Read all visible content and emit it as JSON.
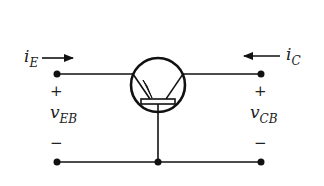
{
  "diagram": {
    "type": "common-base BJT circuit (pnp)",
    "colors": {
      "stroke": "#111111",
      "text": "#222222",
      "background": "#ffffff"
    },
    "labels": {
      "emitter_current": {
        "symbol": "i",
        "subscript": "E",
        "direction": "right"
      },
      "collector_current": {
        "symbol": "i",
        "subscript": "C",
        "direction": "left"
      },
      "emitter_base_voltage": {
        "symbol": "v",
        "subscript": "EB",
        "plus": "+",
        "minus": "−"
      },
      "collector_base_voltage": {
        "symbol": "v",
        "subscript": "CB",
        "plus": "+",
        "minus": "−"
      }
    },
    "components": {
      "transistor": "BJT (emitter arrow pointing inward, pnp)",
      "terminals": [
        "emitter (left)",
        "collector (right)",
        "base (bottom, common)"
      ]
    }
  }
}
